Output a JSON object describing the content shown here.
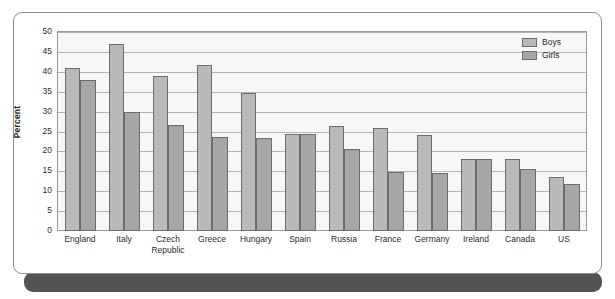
{
  "legend": {
    "position": "top-right",
    "entries": [
      {
        "label": "Boys",
        "color": "#b9b9b9"
      },
      {
        "label": "Girls",
        "color": "#a6a6a6"
      }
    ]
  },
  "axis": {
    "y_title": "Percent",
    "y_ticks": [
      "50",
      "45",
      "40",
      "35",
      "30",
      "25",
      "20",
      "15",
      "10",
      "5",
      "0"
    ]
  },
  "chart_data": {
    "type": "bar",
    "title": "",
    "xlabel": "",
    "ylabel": "Percent",
    "ylim": [
      0,
      50
    ],
    "ytick_step": 5,
    "grid": true,
    "legend_position": "top-right",
    "categories": [
      "England",
      "Italy",
      "Czech Republic",
      "Greece",
      "Hungary",
      "Spain",
      "Russia",
      "France",
      "Germany",
      "Ireland",
      "Canada",
      "US"
    ],
    "series": [
      {
        "name": "Boys",
        "color": "#b9b9b9",
        "values": [
          41.0,
          47.0,
          39.0,
          41.7,
          34.8,
          24.5,
          26.3,
          26.0,
          24.2,
          18.2,
          18.2,
          13.5
        ]
      },
      {
        "name": "Girls",
        "color": "#a6a6a6",
        "values": [
          38.0,
          29.9,
          26.6,
          23.5,
          23.4,
          24.5,
          20.5,
          14.8,
          14.7,
          18.2,
          15.5,
          11.7
        ]
      }
    ]
  }
}
